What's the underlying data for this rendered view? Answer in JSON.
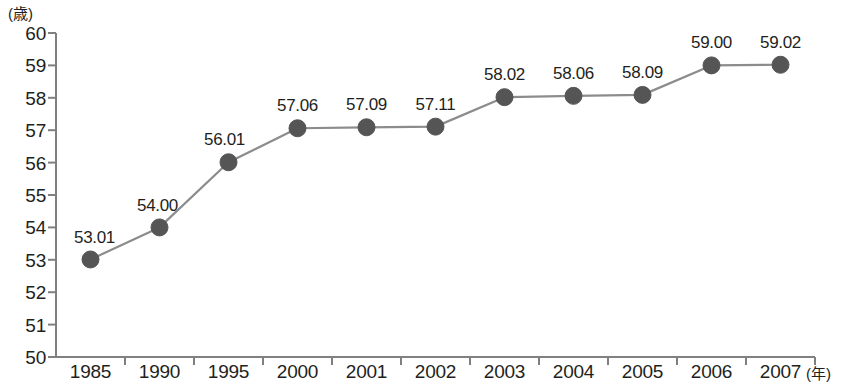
{
  "header": {
    "cut_off_title": "",
    "y_axis_unit": "(歳)",
    "x_axis_unit": "(年)"
  },
  "chart_data": {
    "type": "line",
    "title": "",
    "xlabel": "(年)",
    "ylabel": "(歳)",
    "ylim": [
      50,
      60
    ],
    "ytick_step": 1,
    "ytick_labels": [
      "60",
      "59",
      "58",
      "57",
      "56",
      "55",
      "54",
      "53",
      "52",
      "51",
      "50"
    ],
    "yticks": [
      60,
      59,
      58,
      57,
      56,
      55,
      54,
      53,
      52,
      51,
      50
    ],
    "grid": false,
    "legend": "none",
    "categories": [
      "1985",
      "1990",
      "1995",
      "2000",
      "2001",
      "2002",
      "2003",
      "2004",
      "2005",
      "2006",
      "2007"
    ],
    "values": [
      53.01,
      54.0,
      56.01,
      57.06,
      57.09,
      57.11,
      58.02,
      58.06,
      58.09,
      59.0,
      59.02
    ],
    "point_labels": [
      "53.01",
      "54.00",
      "56.01",
      "57.06",
      "57.09",
      "57.11",
      "58.02",
      "58.06",
      "58.09",
      "59.00",
      "59.02"
    ],
    "marker_color": "#555555",
    "line_color": "#8c8c8c",
    "axis_color": "#808080",
    "text_color": "#231f20"
  }
}
